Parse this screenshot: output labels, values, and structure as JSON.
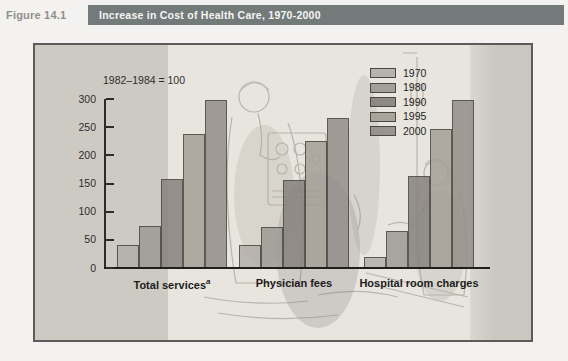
{
  "header": {
    "figure_label": "Figure 14.1",
    "title": "Increase in Cost of Health Care, 1970-2000"
  },
  "colors": {
    "title_bar_bg": "#737a7a",
    "panel_bg": "#cdcac3",
    "illustration_bg": "#e8e5df",
    "axis": "#2c2c29"
  },
  "chart_data": {
    "type": "bar",
    "title": "Increase in Cost of Health Care, 1970-2000",
    "index_note": "1982–1984 = 100",
    "categories": [
      "Total services",
      "Physician fees",
      "Hospital room charges"
    ],
    "category_footnotes": [
      "a",
      "",
      ""
    ],
    "series": [
      {
        "name": "1970",
        "color": "#b3afa8",
        "values": [
          40,
          40,
          19
        ]
      },
      {
        "name": "1980",
        "color": "#9e9a94",
        "values": [
          74,
          72,
          65
        ]
      },
      {
        "name": "1990",
        "color": "#87827d",
        "values": [
          158,
          157,
          163
        ]
      },
      {
        "name": "1995",
        "color": "#a59f97",
        "values": [
          238,
          226,
          247
        ]
      },
      {
        "name": "2000",
        "color": "#938e88",
        "values": [
          298,
          266,
          298
        ]
      }
    ],
    "ylim": [
      0,
      300
    ],
    "y_ticks": [
      0,
      50,
      100,
      150,
      200,
      250,
      300
    ],
    "xlabel": "",
    "ylabel": "",
    "legend_position": "top-right",
    "grid": false
  }
}
